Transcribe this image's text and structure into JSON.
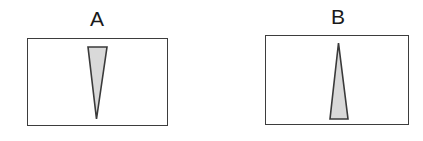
{
  "figure": {
    "width": 423,
    "height": 141,
    "background_color": "#ffffff"
  },
  "style": {
    "box_border_color": "#3d3d3d",
    "box_fill_color": "#ffffff",
    "triangle_fill_color": "#d9d9d9",
    "triangle_stroke_color": "#3a3a3a",
    "label_color": "#1a1a1a"
  },
  "panels": [
    {
      "id": "a",
      "label": "A",
      "box": {
        "x": 27,
        "y": 38,
        "width": 141,
        "height": 88
      },
      "shape": {
        "name": "triangle-pointing-down",
        "orientation": "apex-down",
        "points": "61,9 80,9 69.5,81",
        "top_width": 19,
        "bottom_width": 0,
        "height": 72,
        "fill": "#d9d9d9",
        "stroke": "#3a3a3a",
        "stroke_width": 1.6
      }
    },
    {
      "id": "b",
      "label": "B",
      "box": {
        "x": 265,
        "y": 35,
        "width": 144,
        "height": 90
      },
      "shape": {
        "name": "triangle-pointing-up",
        "orientation": "apex-up",
        "points": "73.5,8 83,84 65,84",
        "top_width": 0,
        "bottom_width": 18,
        "height": 76,
        "fill": "#d9d9d9",
        "stroke": "#3a3a3a",
        "stroke_width": 1.6
      }
    }
  ]
}
